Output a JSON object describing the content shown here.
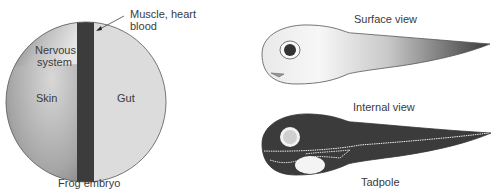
{
  "embryo": {
    "caption": "Frog embryo",
    "regions": {
      "nervous_line1": "Nervous",
      "nervous_line2": "system",
      "skin": "Skin",
      "gut": "Gut",
      "muscle_line1": "Muscle, heart",
      "muscle_line2": "blood"
    }
  },
  "tadpole": {
    "surface_label": "Surface view",
    "internal_label": "Internal view",
    "caption": "Tadpole"
  }
}
